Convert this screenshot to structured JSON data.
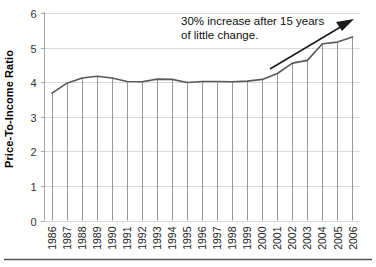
{
  "chart_data": {
    "type": "line",
    "title": "",
    "xlabel": "",
    "ylabel": "Price-To-Income Ratio",
    "ylim": [
      0,
      6
    ],
    "yticks": [
      0,
      1,
      2,
      3,
      4,
      5,
      6
    ],
    "ytick_labels": [
      "0",
      "1",
      "2",
      "3",
      "4",
      "5",
      "6"
    ],
    "grid": true,
    "grid_axis": "y",
    "legend": "none",
    "drop_lines": true,
    "categories": [
      "1986",
      "1987",
      "1988",
      "1989",
      "1990",
      "1991",
      "1992",
      "1993",
      "1994",
      "1995",
      "1996",
      "1997",
      "1998",
      "1999",
      "2000",
      "2001",
      "2002",
      "2003",
      "2004",
      "2005",
      "2006"
    ],
    "series": [
      {
        "name": "Price-To-Income Ratio",
        "values": [
          3.68,
          3.97,
          4.12,
          4.17,
          4.12,
          4.02,
          4.01,
          4.09,
          4.08,
          3.99,
          4.02,
          4.02,
          4.01,
          4.03,
          4.08,
          4.25,
          4.55,
          4.63,
          5.11,
          5.16,
          5.31
        ]
      }
    ],
    "annotations": [
      {
        "name": "growth-callout",
        "line1": "30% increase after 15 years",
        "line2": "of little change.",
        "arrow": "upward-right-arrow"
      }
    ],
    "colors": {
      "line": "#595959",
      "grid": "#d9d9d9",
      "axis": "#a6a6a6",
      "text": "#000000",
      "drop_line": "#8c8c8c",
      "annotation_arrow": "#1a1a1a",
      "footer_rule": "#555555"
    }
  }
}
